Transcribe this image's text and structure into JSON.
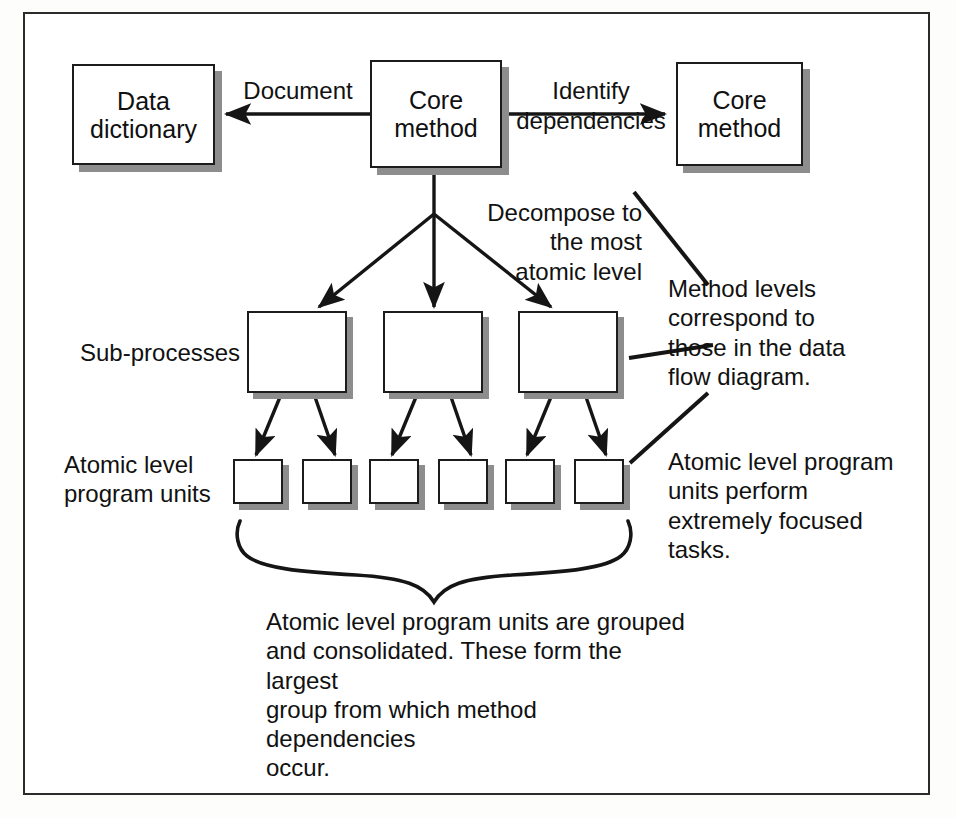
{
  "diagram": {
    "frame": {
      "stroke": "#2b2b2b"
    },
    "colors": {
      "box_fill": "#ffffff",
      "box_stroke": "#1c1c1c",
      "shadow": "#8d8d8d",
      "text": "#111111",
      "line": "#151515"
    },
    "nodes": {
      "data_dictionary": {
        "label": "Data\ndictionary"
      },
      "core_method_center": {
        "label": "Core\nmethod"
      },
      "core_method_right": {
        "label": "Core\nmethod"
      },
      "sub_processes": [
        {
          "label": ""
        },
        {
          "label": ""
        },
        {
          "label": ""
        }
      ],
      "atomic_units": [
        {
          "label": ""
        },
        {
          "label": ""
        },
        {
          "label": ""
        },
        {
          "label": ""
        },
        {
          "label": ""
        },
        {
          "label": ""
        }
      ]
    },
    "edge_labels": {
      "document": "Document",
      "identify_dependencies": "Identify\ndependencies"
    },
    "annotations": {
      "decompose": "Decompose to\nthe most\natomic level",
      "method_levels": "Method levels\ncorrespond to\nthose in the data\nflow diagram.",
      "atomic_perform": "Atomic level program\nunits perform\nextremely focused\ntasks.",
      "caption": "Atomic level program units are grouped\nand consolidated. These form the largest\ngroup from which method dependencies\noccur."
    },
    "row_labels": {
      "sub_processes": "Sub-processes",
      "atomic_units": "Atomic level\nprogram units"
    }
  }
}
